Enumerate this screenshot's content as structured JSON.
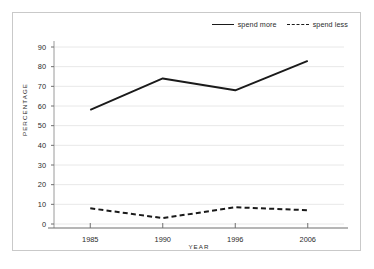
{
  "figure": {
    "background_color": "#ffffff",
    "frame_color": "#c9c9c9"
  },
  "chart_data": {
    "type": "line",
    "title": "",
    "subtitle": "",
    "xlabel": "YEAR",
    "ylabel": "PERCENTAGE",
    "categories": [
      "1985",
      "1990",
      "1996",
      "2006"
    ],
    "series": [
      {
        "name": "spend more",
        "style": "solid",
        "color": "#1a1a1a",
        "values": [
          58,
          74,
          68,
          83
        ]
      },
      {
        "name": "spend less",
        "style": "dashed",
        "color": "#1a1a1a",
        "values": [
          8,
          3,
          8.5,
          7
        ]
      }
    ],
    "ylim": [
      0,
      90
    ],
    "ytick_labels": [
      "0",
      "10",
      "20",
      "30",
      "40",
      "50",
      "60",
      "70",
      "80",
      "90"
    ],
    "ytick_values": [
      0,
      10,
      20,
      30,
      40,
      50,
      60,
      70,
      80,
      90
    ],
    "xtick_labels": [
      "1985",
      "1990",
      "1996",
      "2006"
    ],
    "grid": "horizontal",
    "grid_color": "#e8e8e8",
    "legend_position": "top-right",
    "legend_entries": [
      "spend more",
      "spend less"
    ]
  },
  "legend": {
    "entries": [
      {
        "label": "spend more",
        "swatch": "solid-line-swatch"
      },
      {
        "label": "spend less",
        "swatch": "dashed-line-swatch"
      }
    ]
  }
}
